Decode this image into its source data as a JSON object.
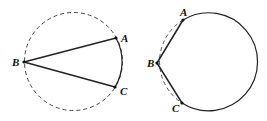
{
  "figures": [
    {
      "id": "left",
      "circle": {
        "cx": 73.5,
        "cy": 61.5,
        "r": 49,
        "style": "dashed"
      },
      "points": [
        {
          "label": "A",
          "x": 116,
          "y": 38,
          "lx": 121,
          "ly": 41
        },
        {
          "label": "B",
          "x": 24,
          "y": 62,
          "lx": 12,
          "ly": 66
        },
        {
          "label": "C",
          "x": 115,
          "y": 87,
          "lx": 120,
          "ly": 95
        }
      ],
      "segments": [
        [
          "B",
          "A"
        ],
        [
          "B",
          "C"
        ]
      ]
    },
    {
      "id": "right",
      "circle": {
        "cx": 206.5,
        "cy": 62,
        "r": 49
      },
      "solid_arc": "A to C major arc",
      "dashed_arc": "A to C minor arc through B",
      "points": [
        {
          "label": "A",
          "x": 183,
          "y": 20,
          "lx": 180,
          "ly": 16
        },
        {
          "label": "B",
          "x": 157,
          "y": 63,
          "lx": 147,
          "ly": 67
        },
        {
          "label": "C",
          "x": 182,
          "y": 103,
          "lx": 172,
          "ly": 112
        }
      ],
      "segments": [
        [
          "B",
          "A"
        ],
        [
          "B",
          "C"
        ]
      ]
    }
  ],
  "colors": {
    "stroke": "#222222",
    "dash": "#555555"
  }
}
